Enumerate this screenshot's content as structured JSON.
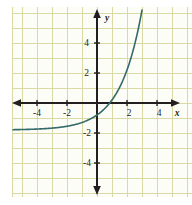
{
  "figure": {
    "caption": "",
    "background_color": "#fdfdf7",
    "grid_color": "#d9d9a6",
    "axis_color": "#231f20",
    "curve_color": "#356a6b"
  },
  "axes": {
    "x_axis_label": "x",
    "y_axis_label": "y",
    "x_tick_labels": [
      "-4",
      "-2",
      "2",
      "4"
    ],
    "y_tick_labels": [
      "4",
      "2",
      "-2",
      "-4"
    ]
  },
  "chart_data": {
    "type": "line",
    "title": "",
    "xlabel": "x",
    "ylabel": "y",
    "xlim": [
      -5.6,
      5.6
    ],
    "ylim": [
      -5.5,
      5.2
    ],
    "xticks": [
      -4,
      -2,
      2,
      4
    ],
    "yticks": [
      4,
      2,
      -2,
      -4
    ],
    "grid": true,
    "grid_step": 1,
    "legend": "none",
    "series": [
      {
        "name": "exponential-curve",
        "equation": "y = 2^x - 1.8",
        "asymptote": -1.8,
        "x_intercept": 1.7,
        "y_intercept": -0.8,
        "x": [
          -5.6,
          -5.0,
          -4.5,
          -4.0,
          -3.5,
          -3.0,
          -2.5,
          -2.0,
          -1.5,
          -1.0,
          -0.5,
          0.0,
          0.5,
          1.0,
          1.5,
          2.0,
          2.5,
          3.0
        ],
        "y": [
          -1.78,
          -1.77,
          -1.76,
          -1.74,
          -1.71,
          -1.67,
          -1.62,
          -1.55,
          -1.45,
          -1.3,
          -1.09,
          -0.8,
          -0.39,
          0.2,
          1.03,
          2.2,
          3.86,
          6.2
        ]
      }
    ]
  }
}
